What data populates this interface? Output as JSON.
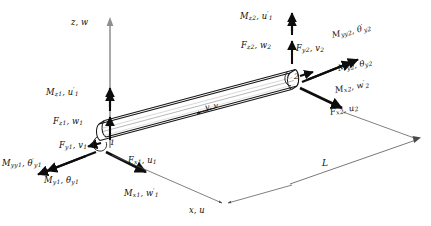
{
  "figure": {
    "type": "engineering-diagram",
    "element_length_label": "L",
    "nodes": [
      {
        "id": "1",
        "number": "1"
      },
      {
        "id": "2",
        "number": "2"
      }
    ]
  },
  "axes": {
    "vertical": {
      "name": "z",
      "dof": "w",
      "label": "z, w"
    },
    "longitudinal": {
      "name": "y",
      "dof": "v",
      "label": "y, v"
    },
    "transverse": {
      "name": "x",
      "dof": "u",
      "label": "x, u"
    }
  },
  "node1": {
    "moment_z": {
      "sym": "M",
      "sub": "z",
      "node": "1",
      "dof": "u",
      "dof_sub": "1",
      "prime": true
    },
    "force_z": {
      "sym": "F",
      "sub": "z",
      "node": "1",
      "dof": "w",
      "dof_sub": "1",
      "prime": false
    },
    "force_y": {
      "sym": "F",
      "sub": "y",
      "node": "1",
      "dof": "v",
      "dof_sub": "1",
      "prime": false
    },
    "force_x": {
      "sym": "F",
      "sub": "x",
      "node": "1",
      "dof": "u",
      "dof_sub": "1",
      "prime": false
    },
    "moment_x": {
      "sym": "M",
      "sub": "x",
      "node": "1",
      "dof": "w",
      "dof_sub": "1",
      "prime": true
    },
    "moment_y": {
      "sym": "M",
      "sub": "y",
      "node": "1",
      "dof": "θ",
      "dof_sub": "y",
      "dof_sub2": "1",
      "prime": false
    },
    "moment_yy": {
      "sym": "M",
      "sub": "yy",
      "node": "1",
      "dof": "θ",
      "dof_sub": "y",
      "dof_sub2": "1",
      "prime": true
    }
  },
  "node2": {
    "moment_z": {
      "sym": "M",
      "sub": "z",
      "node": "2",
      "dof": "u",
      "dof_sub": "1",
      "prime": true
    },
    "force_z": {
      "sym": "F",
      "sub": "z",
      "node": "2",
      "dof": "w",
      "dof_sub": "2",
      "prime": false
    },
    "force_y": {
      "sym": "F",
      "sub": "y",
      "node": "2",
      "dof": "v",
      "dof_sub": "2",
      "prime": false
    },
    "force_x": {
      "sym": "F",
      "sub": "x",
      "node": "2",
      "dof": "u",
      "dof_sub": "2",
      "prime": false
    },
    "moment_x": {
      "sym": "M",
      "sub": "x",
      "node": "2",
      "dof": "w",
      "dof_sub": "2",
      "prime": true
    },
    "moment_y": {
      "sym": "M",
      "sub": "y",
      "node": "2",
      "dof": "θ",
      "dof_sub": "y",
      "dof_sub2": "2",
      "prime": false
    },
    "moment_yy": {
      "sym": "M",
      "sub": "yy",
      "node": "2",
      "dof": "θ",
      "dof_sub": "y",
      "dof_sub2": "2",
      "prime": true
    }
  },
  "labels": {
    "z_axis": "z, w",
    "y_axis": "y, v",
    "x_axis": "x, u",
    "length": "L",
    "node1_num": "1",
    "node2_num": "2"
  },
  "colors": {
    "ink": "#0d0d0d",
    "beam_stroke": "#1a1a1a",
    "axis_gray": "#8a8a8a",
    "thin_line": "#555555",
    "background": "#ffffff"
  }
}
